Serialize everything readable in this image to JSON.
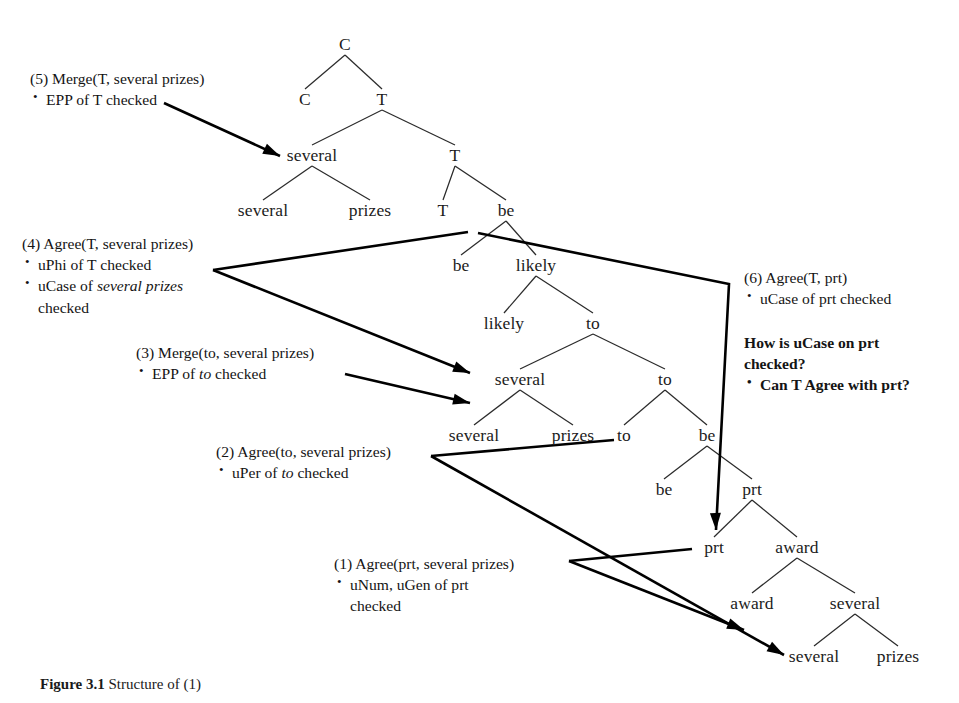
{
  "figure": {
    "caption_label": "Figure 3.1",
    "caption_text": "Structure of (1)"
  },
  "tree": {
    "nodes": [
      {
        "id": "c-root",
        "label": "C",
        "x": 345,
        "y": 45
      },
      {
        "id": "c-spec",
        "label": "C",
        "x": 305,
        "y": 100
      },
      {
        "id": "t-1",
        "label": "T",
        "x": 382,
        "y": 100
      },
      {
        "id": "several-1",
        "label": "several",
        "x": 312,
        "y": 156
      },
      {
        "id": "t-2",
        "label": "T",
        "x": 455,
        "y": 156
      },
      {
        "id": "several-2",
        "label": "several",
        "x": 263,
        "y": 211
      },
      {
        "id": "prizes-1",
        "label": "prizes",
        "x": 370,
        "y": 211
      },
      {
        "id": "t-3",
        "label": "T",
        "x": 443,
        "y": 211
      },
      {
        "id": "be-1",
        "label": "be",
        "x": 506,
        "y": 211
      },
      {
        "id": "be-2",
        "label": "be",
        "x": 461,
        "y": 266
      },
      {
        "id": "likely-1",
        "label": "likely",
        "x": 536,
        "y": 266
      },
      {
        "id": "likely-2",
        "label": "likely",
        "x": 504,
        "y": 324
      },
      {
        "id": "to-1",
        "label": "to",
        "x": 593,
        "y": 324
      },
      {
        "id": "several-3",
        "label": "several",
        "x": 520,
        "y": 380
      },
      {
        "id": "to-2",
        "label": "to",
        "x": 665,
        "y": 380
      },
      {
        "id": "several-4",
        "label": "several",
        "x": 474,
        "y": 436
      },
      {
        "id": "prizes-2",
        "label": "prizes",
        "x": 573,
        "y": 436
      },
      {
        "id": "to-3",
        "label": "to",
        "x": 624,
        "y": 436
      },
      {
        "id": "be-3",
        "label": "be",
        "x": 707,
        "y": 436
      },
      {
        "id": "be-4",
        "label": "be",
        "x": 664,
        "y": 490
      },
      {
        "id": "prt-1",
        "label": "prt",
        "x": 752,
        "y": 490
      },
      {
        "id": "prt-2",
        "label": "prt",
        "x": 714,
        "y": 548
      },
      {
        "id": "award-1",
        "label": "award",
        "x": 797,
        "y": 548
      },
      {
        "id": "award-2",
        "label": "award",
        "x": 752,
        "y": 604
      },
      {
        "id": "several-5",
        "label": "several",
        "x": 855,
        "y": 604
      },
      {
        "id": "several-6",
        "label": "several",
        "x": 814,
        "y": 657
      },
      {
        "id": "prizes-3",
        "label": "prizes",
        "x": 898,
        "y": 657
      }
    ],
    "branches": [
      [
        "c-root",
        "c-spec"
      ],
      [
        "c-root",
        "t-1"
      ],
      [
        "t-1",
        "several-1"
      ],
      [
        "t-1",
        "t-2"
      ],
      [
        "several-1",
        "several-2"
      ],
      [
        "several-1",
        "prizes-1"
      ],
      [
        "t-2",
        "t-3"
      ],
      [
        "t-2",
        "be-1"
      ],
      [
        "be-1",
        "be-2"
      ],
      [
        "be-1",
        "likely-1"
      ],
      [
        "likely-1",
        "likely-2"
      ],
      [
        "likely-1",
        "to-1"
      ],
      [
        "to-1",
        "several-3"
      ],
      [
        "to-1",
        "to-2"
      ],
      [
        "several-3",
        "several-4"
      ],
      [
        "several-3",
        "prizes-2"
      ],
      [
        "to-2",
        "to-3"
      ],
      [
        "to-2",
        "be-3"
      ],
      [
        "be-3",
        "be-4"
      ],
      [
        "be-3",
        "prt-1"
      ],
      [
        "prt-1",
        "prt-2"
      ],
      [
        "prt-1",
        "award-1"
      ],
      [
        "award-1",
        "award-2"
      ],
      [
        "award-1",
        "several-5"
      ],
      [
        "several-5",
        "several-6"
      ],
      [
        "several-5",
        "prizes-3"
      ]
    ]
  },
  "annotations": [
    {
      "id": "ann-5",
      "header": "(5) Merge(T, several prizes)",
      "bullets": [
        {
          "parts": [
            {
              "t": "EPP of T checked",
              "i": false
            }
          ]
        }
      ],
      "x": 30,
      "y": 68
    },
    {
      "id": "ann-4",
      "header": "(4) Agree(T, several prizes)",
      "bullets": [
        {
          "parts": [
            {
              "t": "uPhi of T checked",
              "i": false
            }
          ]
        },
        {
          "parts": [
            {
              "t": "uCase of ",
              "i": false
            },
            {
              "t": "several prizes",
              "i": true
            }
          ],
          "cont": "checked"
        }
      ],
      "x": 22,
      "y": 233
    },
    {
      "id": "ann-3",
      "header": "(3) Merge(to, several prizes)",
      "bullets": [
        {
          "parts": [
            {
              "t": "EPP of ",
              "i": false
            },
            {
              "t": "to",
              "i": true
            },
            {
              "t": " checked",
              "i": false
            }
          ]
        }
      ],
      "x": 136,
      "y": 342
    },
    {
      "id": "ann-2",
      "header": "(2) Agree(to, several prizes)",
      "bullets": [
        {
          "parts": [
            {
              "t": "uPer of ",
              "i": false
            },
            {
              "t": "to",
              "i": true
            },
            {
              "t": " checked",
              "i": false
            }
          ]
        }
      ],
      "x": 216,
      "y": 441
    },
    {
      "id": "ann-1",
      "header": "(1) Agree(prt, several prizes)",
      "bullets": [
        {
          "parts": [
            {
              "t": "uNum, uGen of prt",
              "i": false
            }
          ],
          "cont": "checked"
        }
      ],
      "x": 334,
      "y": 553
    },
    {
      "id": "ann-6",
      "header": "(6) Agree(T, prt)",
      "bullets": [
        {
          "parts": [
            {
              "t": "uCase of prt checked",
              "i": false
            }
          ]
        }
      ],
      "x": 744,
      "y": 267
    }
  ],
  "question_block": {
    "id": "question-6",
    "line1": "How is uCase on prt",
    "line2": "checked?",
    "bullet": "Can T Agree with prt?",
    "x": 744,
    "y": 332
  },
  "colors": {
    "ink": "#1a1a1a",
    "background": "#ffffff",
    "branch": "#2b2b2b",
    "arrow": "#000000"
  },
  "arrows": [
    {
      "id": "arrow-5",
      "from_label": "(5) Merge(T, several prizes)",
      "to_node": "several-1",
      "path": "M 164,103 L 280,156",
      "head": [
        280,
        156,
        -155
      ]
    },
    {
      "id": "arrow-4-up",
      "from_label": "(4) Agree(T, several prizes)",
      "to_node": "t-3",
      "path": "M 213,270 L 468,232",
      "head": null
    },
    {
      "id": "arrow-4-down",
      "from_label": "(4) Agree(T, several prizes)",
      "to_node": "several-3",
      "path": "M 213,270 L 470,373",
      "head": [
        470,
        373,
        -158
      ]
    },
    {
      "id": "arrow-3",
      "from_label": "(3) Merge(to, several prizes)",
      "to_node": "several-3",
      "path": "M 345,374 L 470,403",
      "head": [
        470,
        403,
        -167
      ]
    },
    {
      "id": "arrow-2-up",
      "from_label": "(2) Agree(to, several prizes)",
      "to_node": "prizes-2",
      "path": "M 431,456 L 614,440",
      "head": null
    },
    {
      "id": "arrow-2-down",
      "from_label": "(2) Agree(to, several prizes)",
      "to_node": "several-6",
      "path": "M 431,456 L 784,655",
      "head": [
        784,
        655,
        -150
      ]
    },
    {
      "id": "arrow-1-up",
      "from_label": "(1) Agree(prt, several prizes)",
      "to_node": "prt-2",
      "path": "M 569,561 L 692,549",
      "head": null
    },
    {
      "id": "arrow-1-down",
      "from_label": "(1) Agree(prt, several prizes)",
      "to_node": "award-2",
      "path": "M 569,561 L 744,630",
      "head": [
        744,
        630,
        -158
      ]
    },
    {
      "id": "arrow-6",
      "from_label": "(6) Agree(T, prt)",
      "to_node": "prt-2",
      "path": "M 478,233 L 729,284 L 716,530",
      "head": [
        716,
        530,
        -92
      ]
    }
  ]
}
